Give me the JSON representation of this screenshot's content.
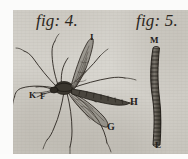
{
  "plate": {
    "title": "Antique engraving plate of a crane fly and its larva",
    "paper_color": "#cfccc5",
    "ink_color": "#24201b",
    "margin_color": "#fbfbfa"
  },
  "figures": [
    {
      "id": "fig-4",
      "caption": "fig: 4.",
      "subject": "crane-fly",
      "description": "Adult crane fly with long legs, two wings and segmented abdomen",
      "labels": [
        {
          "key": "I",
          "text": "I",
          "part": "raised-forewing"
        },
        {
          "key": "K",
          "text": "K",
          "part": "head-antenna"
        },
        {
          "key": "F",
          "text": "F",
          "part": "head-proboscis"
        },
        {
          "key": "G",
          "text": "G",
          "part": "lower-wing"
        },
        {
          "key": "H",
          "text": "H",
          "part": "abdomen-tip"
        }
      ]
    },
    {
      "id": "fig-5",
      "caption": "fig: 5.",
      "subject": "larva",
      "description": "Elongated segmented larva shown vertically",
      "labels": [
        {
          "key": "M",
          "text": "M",
          "part": "larva-head"
        },
        {
          "key": "L",
          "text": "L",
          "part": "larva-tail"
        }
      ]
    }
  ]
}
